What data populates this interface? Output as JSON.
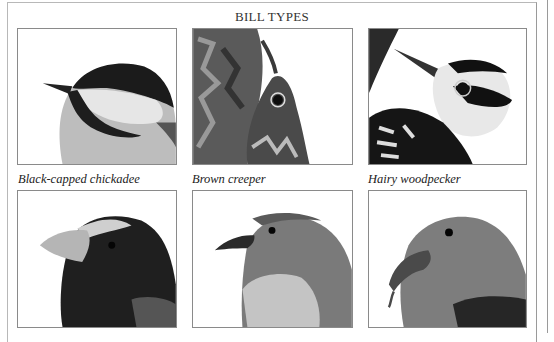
{
  "title": "BILL TYPES",
  "panels": [
    {
      "id": "chickadee",
      "caption": "Black-capped chickadee",
      "image_desc": "Black-capped chickadee head with short pointed bill"
    },
    {
      "id": "creeper",
      "caption": "Brown creeper",
      "image_desc": "Brown creeper with long thin curved bill against tree bark"
    },
    {
      "id": "woodpecker",
      "caption": "Hairy woodpecker",
      "image_desc": "Hairy woodpecker head with chisel-like bill"
    },
    {
      "id": "grosbeak",
      "caption": "",
      "image_desc": "Evening grosbeak head with large conical bill"
    },
    {
      "id": "tanager",
      "caption": "",
      "image_desc": "Songbird head with slender slightly hooked bill"
    },
    {
      "id": "crossbill",
      "caption": "",
      "image_desc": "Crossbill head with crossed bill tips"
    }
  ],
  "colors": {
    "frame": "#9a9a9a",
    "panel_border": "#8a8a8a",
    "text": "#222222"
  }
}
